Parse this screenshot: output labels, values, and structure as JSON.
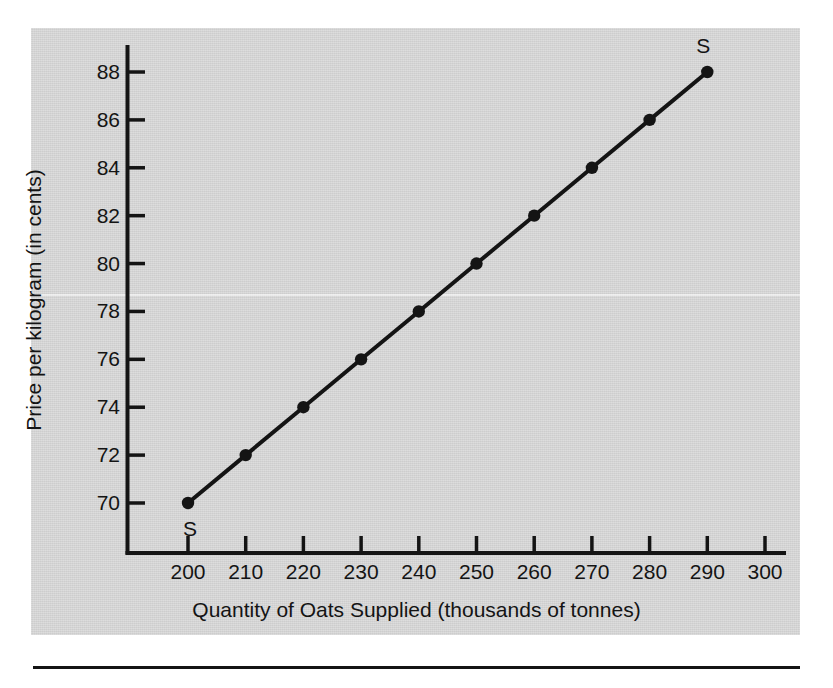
{
  "figure": {
    "panel_color": "#d2d2d2",
    "ink_color": "#141414"
  },
  "chart_data": {
    "type": "line",
    "title": "",
    "xlabel": "Quantity of Oats Supplied (thousands of tonnes)",
    "ylabel": "Price per kilogram (in cents)",
    "xlim": [
      190,
      305
    ],
    "ylim": [
      68.2,
      89.0
    ],
    "xticks": [
      200,
      210,
      220,
      230,
      240,
      250,
      260,
      270,
      280,
      290,
      300
    ],
    "yticks": [
      70,
      72,
      74,
      76,
      78,
      80,
      82,
      84,
      86,
      88
    ],
    "xtick_labels": [
      "200",
      "210",
      "220",
      "230",
      "240",
      "250",
      "260",
      "270",
      "280",
      "290",
      "300"
    ],
    "ytick_labels": [
      "70",
      "72",
      "74",
      "76",
      "78",
      "80",
      "82",
      "84",
      "86",
      "88"
    ],
    "grid": false,
    "legend": "none",
    "series": [
      {
        "name": "S",
        "marker": "filled-circle",
        "x": [
          200,
          210,
          220,
          230,
          240,
          250,
          260,
          270,
          280,
          290
        ],
        "y": [
          70,
          72,
          74,
          76,
          78,
          80,
          82,
          84,
          86,
          88
        ]
      }
    ],
    "annotations": [
      {
        "text": "S",
        "x": 200,
        "y": 70,
        "position": "below-right-of-first-point"
      },
      {
        "text": "S",
        "x": 290,
        "y": 88,
        "position": "above-left-of-last-point"
      }
    ]
  }
}
